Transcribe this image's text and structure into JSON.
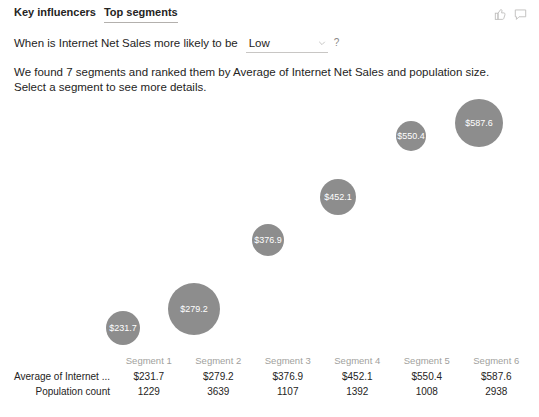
{
  "header": {
    "tabs": [
      {
        "label": "Key influencers",
        "active": false
      },
      {
        "label": "Top segments",
        "active": true
      }
    ],
    "icons": [
      {
        "name": "thumbs-up-icon"
      },
      {
        "name": "comment-icon"
      }
    ]
  },
  "question": {
    "prompt": "When is Internet Net Sales more likely to be",
    "dropdown_value": "Low",
    "dropdown_options": [
      "Low",
      "High"
    ],
    "help_label": "?"
  },
  "description": {
    "line1": "We found 7 segments and ranked them by Average of Internet Net Sales and population size.",
    "line2": "Select a segment to see more details."
  },
  "chart_data": {
    "type": "scatter",
    "title": "",
    "xlabel": "",
    "ylabel": "",
    "bubble_color": "#8d8d8d",
    "label_color": "#ffffff",
    "grid": false,
    "legend": "none",
    "categories": [
      "Segment 1",
      "Segment 2",
      "Segment 3",
      "Segment 4",
      "Segment 5",
      "Segment 6"
    ],
    "series": [
      {
        "name": "Average of Internet Net Sales",
        "values": [
          231.7,
          279.2,
          376.9,
          452.1,
          550.4,
          587.6
        ]
      },
      {
        "name": "Population count",
        "values": [
          1229,
          3639,
          1107,
          1392,
          1008,
          2938
        ]
      }
    ],
    "points": [
      {
        "label": "$231.7",
        "value": 231.7,
        "population": 1229,
        "cx": 123,
        "cy": 231,
        "r": 17
      },
      {
        "label": "$279.2",
        "value": 279.2,
        "population": 3639,
        "cx": 194,
        "cy": 212,
        "r": 26
      },
      {
        "label": "$376.9",
        "value": 376.9,
        "population": 1107,
        "cx": 268,
        "cy": 143,
        "r": 16
      },
      {
        "label": "$452.1",
        "value": 452.1,
        "population": 1392,
        "cx": 338,
        "cy": 100,
        "r": 18
      },
      {
        "label": "$550.4",
        "value": 550.4,
        "population": 1008,
        "cx": 411,
        "cy": 39,
        "r": 15
      },
      {
        "label": "$587.6",
        "value": 587.6,
        "population": 2938,
        "cx": 479,
        "cy": 26,
        "r": 24
      }
    ]
  },
  "table": {
    "corner": "",
    "columns": [
      "Segment 1",
      "Segment 2",
      "Segment 3",
      "Segment 4",
      "Segment 5",
      "Segment 6"
    ],
    "rows": [
      {
        "label": "Average of Internet ...",
        "values": [
          "$231.7",
          "$279.2",
          "$376.9",
          "$452.1",
          "$550.4",
          "$587.6"
        ]
      },
      {
        "label": "Population count",
        "values": [
          "1229",
          "3639",
          "1107",
          "1392",
          "1008",
          "2938"
        ]
      }
    ]
  }
}
